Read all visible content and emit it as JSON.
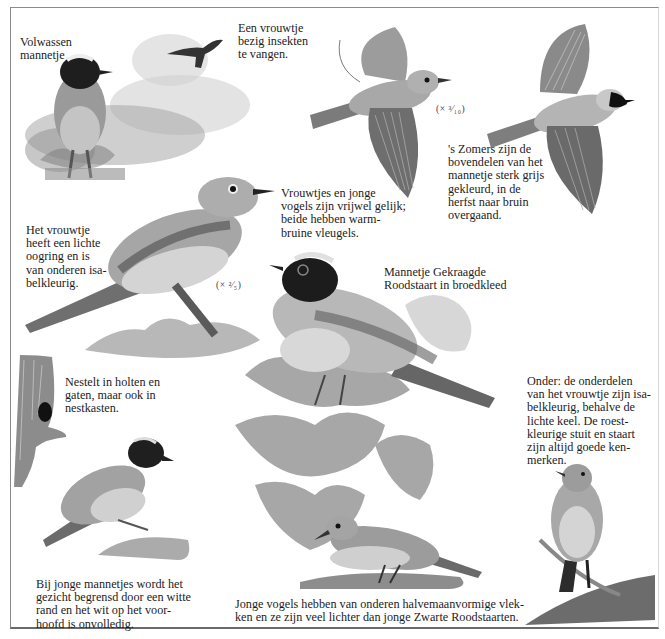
{
  "page": {
    "type": "bird-field-guide-page",
    "language": "nl"
  },
  "captions": {
    "adult_male": "Volwassen\nmannetje",
    "female_catching": "Een vrouwtje\nbezig insekten\nte vangen.",
    "summer_upperparts": "'s Zomers zijn de\nbovendelen van het\nmannetje sterk grijs\ngekleurd, in de\nherfst naar bruin\novergaand.",
    "females_juveniles": "Vrouwtjes en jonge\nvogels zijn vrijwel gelijk;\nbeide hebben warm-\nbruine vleugels.",
    "female_eyering": "Het vrouwtje\nheeft een lichte\noogring en is\nvan onderen isa-\nbelkleurig.",
    "collared_male": "Mannetje Gekraagde\nRoodstaart in broedkleed",
    "nesting": "Nestelt in holten en\ngaten, maar ook in\nnestkasten.",
    "young_males": "Bij jonge mannetjes wordt het\ngezicht begrensd door een witte\nrand en het wit op het voor-\nhoofd is onvolledig.",
    "female_underparts": "Onder: de onderdelen\nvan het vrouwtje zijn isa-\nbelkleurig, behalve de\nlichte keel. De roest-\nkleurige stuit en staart\nzijn altijd goede ken-\nmerken.",
    "juveniles": "Jonge vogels hebben van onderen halvemaanvormige vlek-\nken en ze zijn veel lichter dan jonge Zwarte Roodstaarten."
  },
  "scales": {
    "flight": "(× ³⁄₁₀)",
    "perched": "(× ²⁄₅)"
  },
  "illustrations": [
    {
      "id": "adult-male-perched",
      "label": "adult male redstart on stump"
    },
    {
      "id": "female-flycatching",
      "label": "small flying female silhouette"
    },
    {
      "id": "female-flight",
      "label": "female in flight"
    },
    {
      "id": "male-flight",
      "label": "male in flight"
    },
    {
      "id": "female-perched",
      "label": "female perched on branch"
    },
    {
      "id": "collared-male",
      "label": "collared male on oak leaves"
    },
    {
      "id": "tree-hole",
      "label": "tree trunk with nesting hole"
    },
    {
      "id": "young-male",
      "label": "young male on moss"
    },
    {
      "id": "juvenile",
      "label": "juvenile on ground"
    },
    {
      "id": "female-front",
      "label": "female front view on branch"
    }
  ],
  "colors": {
    "ink": "#1c1c1c",
    "border": "#8a8a8a",
    "bird_gray": "#8c8c8c",
    "bird_dark": "#2a2a2a"
  }
}
